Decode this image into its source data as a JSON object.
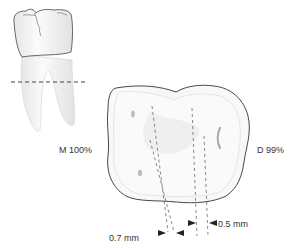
{
  "figure": {
    "type": "dental-diagram",
    "labels": {
      "mesial": "M 100%",
      "distal": "D 99%",
      "left_measure": "0.7 mm",
      "right_measure": "0.5 mm"
    },
    "colors": {
      "outline": "#333333",
      "dash": "#555555",
      "tooth_fill": "#f4f4f4",
      "shadow": "#d8d8d8",
      "text": "#333333"
    }
  }
}
